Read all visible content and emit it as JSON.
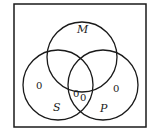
{
  "diagram": {
    "type": "venn",
    "frame": {
      "x": 14,
      "y": 4,
      "width": 132,
      "height": 123,
      "stroke": "#1a1a1a"
    },
    "circles": [
      {
        "id": "M",
        "label": "M",
        "cx": 82,
        "cy": 57,
        "r": 35
      },
      {
        "id": "S",
        "label": "S",
        "cx": 58,
        "cy": 85,
        "r": 35
      },
      {
        "id": "P",
        "label": "P",
        "cx": 103,
        "cy": 85,
        "r": 35
      }
    ],
    "labels": {
      "M": "M",
      "S": "S",
      "P": "P"
    },
    "region_values": {
      "S_only": "0",
      "P_only": "0",
      "S_and_P_not_M_a": "0",
      "S_and_P_not_M_b": "0"
    }
  }
}
